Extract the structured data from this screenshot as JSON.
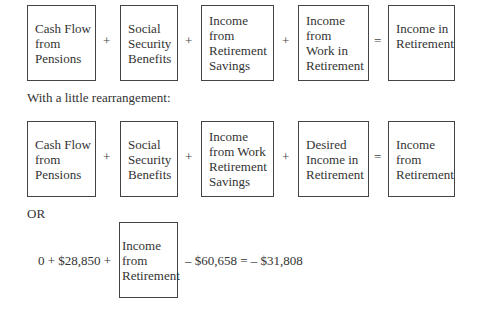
{
  "row1": {
    "terms": [
      "Cash Flow\nfrom\nPensions",
      "Social\nSecurity\nBenefits",
      "Income\nfrom\nRetirement\nSavings",
      "Income\nfrom\nWork in\nRetirement",
      "Income in\nRetirement"
    ],
    "operators": [
      "+",
      "+",
      "+",
      "="
    ]
  },
  "caption": "With a little rearrangement:",
  "row2": {
    "terms": [
      "Cash Flow\nfrom\nPensions",
      "Social\nSecurity\nBenefits",
      "Income\nfrom Work\nRetirement\nSavings",
      "Desired\nIncome in\nRetirement",
      "Income\nfrom\nRetirement"
    ],
    "operators": [
      "+",
      "+",
      "+",
      "="
    ]
  },
  "or_label": "OR",
  "row3": {
    "prefix": "0 + $28,850 +",
    "term": "Income\nfrom\nRetirement",
    "suffix": "– $60,658 = – $31,808"
  }
}
